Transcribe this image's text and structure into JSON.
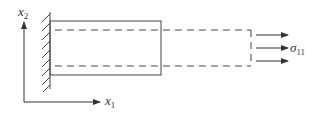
{
  "diagram": {
    "type": "cantilever-beam-stress",
    "axes": {
      "x2": {
        "symbol": "x",
        "subscript": "2"
      },
      "x1": {
        "symbol": "x",
        "subscript": "1"
      }
    },
    "load": {
      "symbol": "σ",
      "subscript": "11"
    },
    "colors": {
      "stroke": "#444444",
      "text": "#333333",
      "background": "#ffffff"
    }
  }
}
